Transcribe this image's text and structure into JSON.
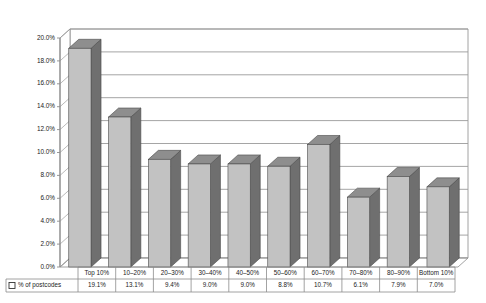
{
  "chart_data": {
    "type": "bar",
    "title": "",
    "xlabel": "",
    "ylabel": "",
    "ylim": [
      0,
      20
    ],
    "ytick_step": 2,
    "grid": true,
    "legend_position": "table-left",
    "three_d": true,
    "categories": [
      "Top 10%",
      "10–20%",
      "20–30%",
      "30–40%",
      "40–50%",
      "50–60%",
      "60–70%",
      "70–80%",
      "80–90%",
      "Bottom 10%"
    ],
    "series": [
      {
        "name": "% of postcodes",
        "values": [
          19.1,
          13.1,
          9.4,
          9.0,
          9.0,
          8.8,
          10.7,
          6.1,
          7.9,
          7.0
        ],
        "value_labels": [
          "19.1%",
          "13.1%",
          "9.4%",
          "9.0%",
          "9.0%",
          "8.8%",
          "10.7%",
          "6.1%",
          "7.9%",
          "7.0%"
        ]
      }
    ],
    "ytick_labels": [
      "20.0%",
      "18.0%",
      "16.0%",
      "14.0%",
      "12.0%",
      "10.0%",
      "8.0%",
      "6.0%",
      "4.0%",
      "2.0%",
      "0.0%"
    ],
    "ytick_values": [
      20,
      18,
      16,
      14,
      12,
      10,
      8,
      6,
      4,
      2,
      0
    ],
    "colors": {
      "bar_front": "#c2c2c2",
      "bar_top": "#8e8e8e",
      "bar_side": "#6f6f6f",
      "bar_outline": "#4a4a4a",
      "gridline": "#9b9b9b",
      "axis": "#8c8c8c",
      "wall": "#ffffff",
      "text": "#1a1a1a",
      "table_border": "#8c8c8c"
    }
  },
  "legend": {
    "marker_icon": "legend-square-icon",
    "label": "% of postcodes"
  },
  "table": {
    "row_header": "% of postcodes",
    "columns": [
      "Top 10%",
      "10–20%",
      "20–30%",
      "30–40%",
      "40–50%",
      "50–60%",
      "60–70%",
      "70–80%",
      "80–90%",
      "Bottom 10%"
    ],
    "values": [
      "19.1%",
      "13.1%",
      "9.4%",
      "9.0%",
      "9.0%",
      "8.8%",
      "10.7%",
      "6.1%",
      "7.9%",
      "7.0%"
    ]
  }
}
